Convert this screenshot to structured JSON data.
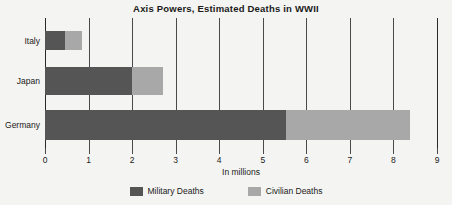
{
  "chart_data": {
    "type": "bar",
    "orientation": "horizontal",
    "stacked": true,
    "title": "Axis Powers, Estimated Deaths in WWII",
    "xlabel": "In millions",
    "ylabel": "",
    "xlim": [
      0,
      9
    ],
    "xticks": [
      "0",
      "1",
      "2",
      "3",
      "4",
      "5",
      "6",
      "7",
      "8",
      "9"
    ],
    "grid": true,
    "legend_position": "bottom",
    "categories": [
      "Italy",
      "Japan",
      "Germany"
    ],
    "series": [
      {
        "name": "Military Deaths",
        "color": "#555555",
        "values": [
          0.45,
          2.0,
          5.53
        ]
      },
      {
        "name": "Civilian Deaths",
        "color": "#a8a8a8",
        "values": [
          0.4,
          0.7,
          2.85
        ]
      }
    ],
    "totals": [
      0.85,
      2.7,
      8.38
    ]
  },
  "colors": {
    "background": "#f4f4f2",
    "axis": "#4a4a4a",
    "text": "#1a1a1a",
    "military": "#555555",
    "civilian": "#a8a8a8"
  }
}
